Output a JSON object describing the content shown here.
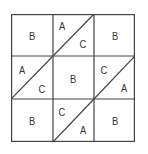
{
  "diagram": {
    "rows": 3,
    "cols": 3,
    "line_color": "#444444",
    "cells": [
      {
        "row": 0,
        "col": 0,
        "type": "full",
        "label": "B"
      },
      {
        "row": 0,
        "col": 1,
        "type": "split",
        "top_left": "A",
        "bottom_right": "C"
      },
      {
        "row": 0,
        "col": 2,
        "type": "full",
        "label": "B"
      },
      {
        "row": 1,
        "col": 0,
        "type": "split",
        "top_left": "A",
        "bottom_right": "C"
      },
      {
        "row": 1,
        "col": 1,
        "type": "full",
        "label": "B"
      },
      {
        "row": 1,
        "col": 2,
        "type": "split",
        "top_left": "C",
        "bottom_right": "A"
      },
      {
        "row": 2,
        "col": 0,
        "type": "full",
        "label": "B"
      },
      {
        "row": 2,
        "col": 1,
        "type": "split",
        "top_left": "C",
        "bottom_right": "A"
      },
      {
        "row": 2,
        "col": 2,
        "type": "full",
        "label": "B"
      }
    ],
    "labels": {
      "r0c0": "B",
      "r0c1_tl": "A",
      "r0c1_br": "C",
      "r0c2": "B",
      "r1c0_tl": "A",
      "r1c0_br": "C",
      "r1c1": "B",
      "r1c2_tl": "C",
      "r1c2_br": "A",
      "r2c0": "B",
      "r2c1_tl": "C",
      "r2c1_br": "A",
      "r2c2": "B"
    }
  }
}
